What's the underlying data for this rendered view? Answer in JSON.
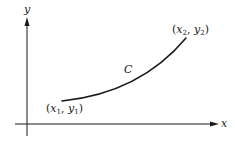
{
  "diagram": {
    "type": "coordinate-curve",
    "axes": {
      "x_label": "x",
      "y_label": "y"
    },
    "curve": {
      "label": "C",
      "start_point": {
        "label_var_x": "x",
        "label_var_y": "y",
        "subscript": "1",
        "text": "(x1, y1)"
      },
      "end_point": {
        "label_var_x": "x",
        "label_var_y": "y",
        "subscript": "2",
        "text": "(x2, y2)"
      }
    },
    "colors": {
      "stroke": "#1a1a1a",
      "background": "#ffffff"
    }
  }
}
